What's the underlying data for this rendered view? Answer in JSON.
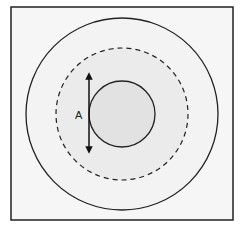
{
  "diagram": {
    "frame": {
      "x": 11,
      "y": 7,
      "width": 222,
      "height": 213,
      "fill": "#f6f6f6",
      "stroke": "#222222"
    },
    "center": {
      "x": 122,
      "y": 114
    },
    "outer_circle": {
      "r": 96,
      "fill": "#f3f3f3",
      "stroke": "#222222",
      "style": "solid"
    },
    "dashed_circle": {
      "r": 66,
      "fill": "#ebebeb",
      "stroke": "#222222",
      "style": "dashed"
    },
    "inner_circle": {
      "r": 33,
      "fill": "#e2e2e2",
      "stroke": "#222222",
      "style": "solid"
    },
    "arrow": {
      "x": 89,
      "y1": 72,
      "y2": 154,
      "label": "A",
      "direction": "double-headed vertical"
    },
    "label_A": "A"
  }
}
